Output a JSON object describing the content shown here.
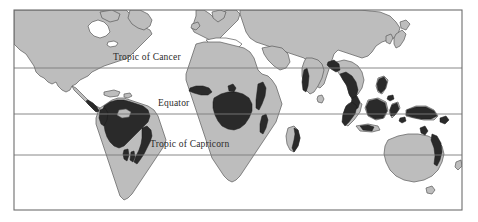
{
  "figure": {
    "name": "world-rainforest-distribution-map",
    "projection": "equirectangular",
    "frame": {
      "x": 14,
      "y": 10,
      "width": 448,
      "height": 200
    }
  },
  "colors": {
    "ocean": "#ffffff",
    "land": "#bdbdbd",
    "land_outline": "#5a5a5a",
    "rainforest": "#2a2a2a",
    "frame_border": "#6d6d6d",
    "latitude_line": "#7a7a7a",
    "label_text": "#2b2b2b",
    "page_background": "#ffffff"
  },
  "latitude_lines": [
    {
      "id": "tropic-of-cancer",
      "label": "Tropic of Cancer",
      "y": 68,
      "label_x": 113,
      "label_y": 60,
      "degrees": 23.5
    },
    {
      "id": "equator",
      "label": "Equator",
      "y": 114,
      "label_x": 158,
      "label_y": 106,
      "degrees": 0
    },
    {
      "id": "tropic-of-capricorn",
      "label": "Tropic of Capricorn",
      "y": 155,
      "label_x": 150,
      "label_y": 147,
      "degrees": -23.5
    }
  ],
  "landmasses": [
    {
      "id": "north-america",
      "label": "North America"
    },
    {
      "id": "central-america",
      "label": "Central America"
    },
    {
      "id": "south-america",
      "label": "South America"
    },
    {
      "id": "greenland",
      "label": "Greenland"
    },
    {
      "id": "europe",
      "label": "Europe"
    },
    {
      "id": "africa",
      "label": "Africa"
    },
    {
      "id": "madagascar",
      "label": "Madagascar"
    },
    {
      "id": "asia",
      "label": "Asia"
    },
    {
      "id": "india",
      "label": "India"
    },
    {
      "id": "japan",
      "label": "Japan"
    },
    {
      "id": "southeast-asia-islands",
      "label": "Southeast Asia Islands"
    },
    {
      "id": "new-guinea",
      "label": "New Guinea"
    },
    {
      "id": "australia",
      "label": "Australia"
    },
    {
      "id": "tasmania",
      "label": "Tasmania"
    },
    {
      "id": "sri-lanka",
      "label": "Sri Lanka"
    }
  ],
  "rainforest_regions": [
    {
      "id": "amazon-basin",
      "label": "Amazon Basin"
    },
    {
      "id": "brazil-atlantic-coast",
      "label": "Atlantic Coastal Forest"
    },
    {
      "id": "central-america-forest",
      "label": "Central American Forest"
    },
    {
      "id": "west-africa-forest",
      "label": "West African Forest"
    },
    {
      "id": "congo-basin",
      "label": "Congo Basin"
    },
    {
      "id": "east-africa-strip",
      "label": "East African Strip"
    },
    {
      "id": "madagascar-east",
      "label": "Madagascar East Coast"
    },
    {
      "id": "western-ghats",
      "label": "Western Ghats"
    },
    {
      "id": "southeast-asia-mainland",
      "label": "Southeast Asia Mainland"
    },
    {
      "id": "sumatra",
      "label": "Sumatra"
    },
    {
      "id": "borneo",
      "label": "Borneo"
    },
    {
      "id": "new-guinea-forest",
      "label": "New Guinea Forest"
    },
    {
      "id": "philippines",
      "label": "Philippines"
    },
    {
      "id": "australia-east-coast",
      "label": "Australia East Coast"
    }
  ]
}
